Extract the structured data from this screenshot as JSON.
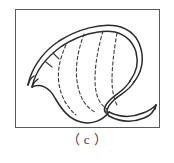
{
  "figure": {
    "caption": "（ c ）",
    "caption_plain": "( c )",
    "panel_label": "c",
    "frame": {
      "x": 15,
      "y": 9,
      "width": 145,
      "height": 119,
      "border_color": "#5a5a5e",
      "background": "#ffffff"
    },
    "line_color": "#2b2b2d",
    "dash_color": "#3a3a3c"
  },
  "drawing": {
    "title": "stomach-line-drawing",
    "description": "Line drawing of a stomach: esophagus enters at left, body and fundus form the large curved sac, pylorus and duodenum exit at lower right; dashed curves inside depict gastric rugae folds.",
    "parts": [
      {
        "name": "esophagus",
        "style": "double-line",
        "position": "left"
      },
      {
        "name": "fundus",
        "style": "double-line",
        "position": "top"
      },
      {
        "name": "greater-curvature",
        "style": "single-line",
        "position": "bottom-left"
      },
      {
        "name": "lesser-curvature",
        "style": "double-line",
        "position": "right"
      },
      {
        "name": "pylorus",
        "style": "double-line",
        "position": "bottom-right"
      },
      {
        "name": "duodenum",
        "style": "double-line",
        "position": "right-outlet"
      },
      {
        "name": "rugae-folds",
        "style": "dashed",
        "count": 4,
        "position": "interior"
      }
    ],
    "paths": {
      "outer_wall_upper": "M 12,74 C 16,60 26,44 44,32 C 62,20 84,14 100,17 C 112,19 120,26 123,37 C 126,48 124,60 118,70",
      "outer_wall_upper_inner": "M 15,76 C 19,63 29,48 46,36 C 63,25 83,19 98,21 C 109,23 116,30 119,39 C 122,49 120,60 114,69",
      "greater_curvature": "M 12,74 C 22,72 32,76 38,86 C 45,98 52,108 64,111 C 76,114 86,110 92,103",
      "lesser_curvature": "M 118,70 C 112,79 102,84 96,90 C 90,96 88,102 92,106",
      "pylorus_duodenum_outer": "M 92,103 C 102,108 114,109 126,104 C 132,102 136,99 139,96",
      "pylorus_duodenum_inner": "M 95,108 C 105,112 116,113 127,108 C 133,106 137,103 139,96",
      "esophagus_upper": "M 12,74 L 18,68",
      "esophagus_lower": "M 15,76 L 21,70",
      "rugae_1": "M 48,36 C 44,48 42,60 44,72 C 46,84 52,94 60,102",
      "rugae_2": "M 66,25 C 62,40 60,56 62,70 C 64,84 68,94 78,100",
      "rugae_3": "M 86,22 C 82,38 80,54 80,68 C 80,82 82,92 90,98",
      "rugae_4": "M 100,24 C 98,40 96,56 96,70 C 96,82 98,90 100,95",
      "rugae_tick_1": "M 36,44 L 42,50",
      "rugae_tick_2": "M 30,52 L 36,58"
    }
  }
}
